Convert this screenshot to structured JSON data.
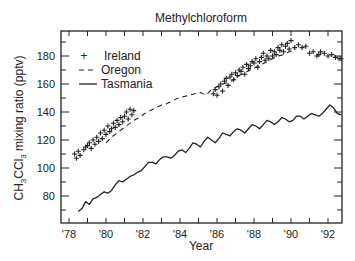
{
  "chart_data": {
    "type": "line",
    "title": "Methylchloroform",
    "xlabel": "Year",
    "ylabel": "CH3CCl3 mixing ratio (pptv)",
    "ylabel_parts": {
      "a": "CH",
      "s1": "3",
      "b": "CCl",
      "s2": "3",
      "c": " mixing ratio (pptv)"
    },
    "xlim": [
      1977.6,
      1992.8
    ],
    "ylim": [
      61,
      198
    ],
    "x_ticks": [
      1978,
      1979,
      1980,
      1981,
      1982,
      1983,
      1984,
      1985,
      1986,
      1987,
      1988,
      1989,
      1990,
      1991,
      1992
    ],
    "x_tick_labels": [
      {
        "year": 1978,
        "label": "'78"
      },
      {
        "year": 1980,
        "label": "'80"
      },
      {
        "year": 1982,
        "label": "'82"
      },
      {
        "year": 1984,
        "label": "'84"
      },
      {
        "year": 1986,
        "label": "'86"
      },
      {
        "year": 1988,
        "label": "'88"
      },
      {
        "year": 1990,
        "label": "'90"
      },
      {
        "year": 1992,
        "label": "'92"
      }
    ],
    "y_ticks": [
      70,
      80,
      90,
      100,
      110,
      120,
      130,
      140,
      150,
      160,
      170,
      180,
      190
    ],
    "y_tick_labels": [
      80,
      100,
      120,
      140,
      160,
      180
    ],
    "grid": false,
    "legend_position": "upper left",
    "legend": [
      {
        "name": "Ireland",
        "style": "plus-markers"
      },
      {
        "name": "Oregon",
        "style": "dashed"
      },
      {
        "name": "Tasmania",
        "style": "solid"
      }
    ],
    "series": [
      {
        "name": "Tasmania",
        "style": "solid",
        "x": [
          1978.5,
          1978.7,
          1978.9,
          1979.1,
          1979.3,
          1979.5,
          1979.7,
          1979.9,
          1980.1,
          1980.3,
          1980.5,
          1980.7,
          1980.9,
          1981.1,
          1981.3,
          1981.5,
          1981.7,
          1981.9,
          1982.1,
          1982.3,
          1982.5,
          1982.7,
          1982.9,
          1983.1,
          1983.3,
          1983.5,
          1983.7,
          1983.9,
          1984.1,
          1984.3,
          1984.5,
          1984.7,
          1984.9,
          1985.1,
          1985.3,
          1985.5,
          1985.7,
          1985.9,
          1986.1,
          1986.3,
          1986.5,
          1986.7,
          1986.9,
          1987.1,
          1987.3,
          1987.5,
          1987.7,
          1987.9,
          1988.1,
          1988.3,
          1988.5,
          1988.7,
          1988.9,
          1989.1,
          1989.3,
          1989.5,
          1989.7,
          1989.9,
          1990.1,
          1990.3,
          1990.5,
          1990.7,
          1990.9,
          1991.1,
          1991.3,
          1991.5,
          1991.7,
          1991.9,
          1992.1,
          1992.3,
          1992.5,
          1992.7
        ],
        "values": [
          69,
          71,
          76,
          74,
          78,
          79,
          81,
          83,
          82,
          84,
          88,
          91,
          90,
          92,
          94,
          95,
          97,
          98,
          101,
          104,
          104,
          103,
          106,
          108,
          108,
          107,
          109,
          112,
          113,
          111,
          114,
          118,
          117,
          115,
          119,
          122,
          120,
          118,
          121,
          125,
          124,
          123,
          126,
          128,
          127,
          125,
          128,
          131,
          130,
          128,
          131,
          134,
          133,
          131,
          133,
          136,
          135,
          133,
          134,
          137,
          137,
          135,
          137,
          139,
          138,
          137,
          139,
          142,
          145,
          143,
          139,
          138
        ]
      },
      {
        "name": "Ireland",
        "style": "plus-markers",
        "x": [
          1978.3,
          1978.4,
          1978.5,
          1978.6,
          1978.8,
          1978.9,
          1979.0,
          1979.1,
          1979.2,
          1979.3,
          1979.4,
          1979.5,
          1979.6,
          1979.7,
          1979.8,
          1979.9,
          1980.0,
          1980.1,
          1980.2,
          1980.3,
          1980.4,
          1980.5,
          1980.6,
          1980.7,
          1980.8,
          1980.9,
          1981.0,
          1981.1,
          1981.2,
          1981.3,
          1981.4,
          1981.5,
          1985.8,
          1985.9,
          1986.0,
          1986.1,
          1986.2,
          1986.3,
          1986.4,
          1986.5,
          1986.6,
          1986.7,
          1986.8,
          1986.9,
          1987.0,
          1987.1,
          1987.2,
          1987.3,
          1987.4,
          1987.5,
          1987.6,
          1987.7,
          1987.8,
          1987.9,
          1988.0,
          1988.1,
          1988.2,
          1988.3,
          1988.4,
          1988.5,
          1988.6,
          1988.7,
          1988.8,
          1988.9,
          1989.0,
          1989.1,
          1989.2,
          1989.3,
          1989.4,
          1989.5,
          1989.6,
          1989.7,
          1989.8,
          1989.9,
          1990.0,
          1990.2,
          1990.4,
          1990.6,
          1990.8,
          1991.0,
          1991.2,
          1991.4,
          1991.5,
          1991.6,
          1991.8,
          1992.0,
          1992.2,
          1992.4,
          1992.6,
          1992.7
        ],
        "values": [
          110,
          107,
          112,
          109,
          113,
          115,
          116,
          118,
          114,
          120,
          117,
          122,
          119,
          125,
          121,
          127,
          124,
          130,
          126,
          128,
          132,
          129,
          134,
          131,
          136,
          133,
          137,
          140,
          135,
          142,
          138,
          141,
          153,
          156,
          152,
          158,
          160,
          155,
          162,
          164,
          159,
          165,
          167,
          163,
          168,
          166,
          170,
          169,
          172,
          167,
          174,
          171,
          173,
          176,
          175,
          178,
          172,
          176,
          179,
          182,
          177,
          180,
          178,
          184,
          180,
          183,
          181,
          186,
          184,
          188,
          183,
          187,
          189,
          185,
          191,
          186,
          188,
          186,
          187,
          182,
          183,
          180,
          181,
          183,
          182,
          180,
          181,
          179,
          178,
          178
        ]
      },
      {
        "name": "Oregon",
        "style": "dashed",
        "x": [
          1980.0,
          1980.3,
          1980.6,
          1980.9,
          1981.2,
          1981.5,
          1981.8,
          1982.1,
          1982.4,
          1982.7,
          1983.0,
          1983.3,
          1983.6,
          1983.9,
          1984.2,
          1984.5,
          1984.8,
          1985.1,
          1985.4,
          1985.7,
          1986.0,
          1986.3,
          1986.6,
          1986.9,
          1987.2,
          1987.5,
          1987.8,
          1988.1,
          1988.4,
          1988.7,
          1989.0,
          1989.3,
          1989.6,
          1989.9,
          1990.2
        ],
        "values": [
          118,
          122,
          125,
          128,
          131,
          134,
          136,
          139,
          141,
          143,
          145,
          146,
          148,
          150,
          151,
          152,
          153,
          154,
          152,
          156,
          158,
          160,
          161,
          163,
          166,
          168,
          170,
          172,
          174,
          176,
          178,
          180,
          181,
          183,
          185
        ]
      }
    ]
  }
}
